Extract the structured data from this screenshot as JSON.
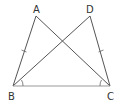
{
  "diagram": {
    "type": "geometry",
    "points": {
      "A": {
        "label": "A",
        "x": 36,
        "y": 16
      },
      "D": {
        "label": "D",
        "x": 90,
        "y": 16
      },
      "B": {
        "label": "B",
        "x": 13,
        "y": 86
      },
      "C": {
        "label": "C",
        "x": 110,
        "y": 86
      }
    },
    "segments": [
      "AB",
      "AC",
      "DB",
      "DC",
      "BC"
    ],
    "equal_marks": [
      "AB",
      "DC"
    ],
    "angle_marks": [
      "ABC",
      "DCB"
    ],
    "colors": {
      "line": "#555555",
      "base": "#999999",
      "text": "#333333"
    }
  }
}
